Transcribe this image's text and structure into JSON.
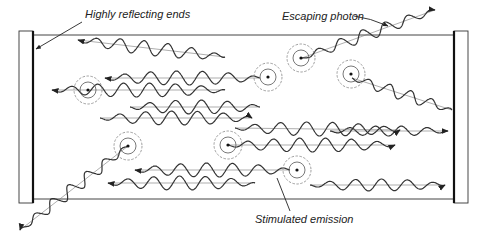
{
  "diagram": {
    "labels": {
      "reflecting_ends": "Highly reflecting ends",
      "escaping_photon": "Escaping photon",
      "stimulated_emission": "Stimulated emission"
    },
    "components": {
      "left_mirror": "highly-reflecting-end",
      "right_mirror": "highly-reflecting-end",
      "tube": "laser-medium",
      "excited_atom_count": 7,
      "photon_wave_count": 14
    },
    "colors": {
      "ink": "#333333",
      "background": "#ffffff"
    }
  }
}
